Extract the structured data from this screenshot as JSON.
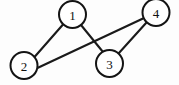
{
  "figure": {
    "background_color": "#fdfdfd",
    "ink_color": "#141414",
    "width": 179,
    "height": 85
  },
  "graph_data": {
    "type": "node-link-diagram",
    "directed": false,
    "node_radius": 13.5,
    "nodes": [
      {
        "id": "1",
        "label": "1",
        "cx": 72.5,
        "cy": 14.5
      },
      {
        "id": "2",
        "label": "2",
        "cx": 24.0,
        "cy": 65.5
      },
      {
        "id": "3",
        "label": "3",
        "cx": 109.5,
        "cy": 63.5
      },
      {
        "id": "4",
        "label": "4",
        "cx": 156.0,
        "cy": 12.5
      }
    ],
    "edges": [
      {
        "id": "e12",
        "source": "1",
        "target": "2",
        "x1": 63.0,
        "y1": 24.5,
        "x2": 34.5,
        "y2": 57.0
      },
      {
        "id": "e13",
        "source": "1",
        "target": "3",
        "x1": 81.0,
        "y1": 25.0,
        "x2": 103.0,
        "y2": 52.0
      },
      {
        "id": "e24",
        "source": "2",
        "target": "4",
        "x1": 37.4,
        "y1": 68.0,
        "x2": 143.0,
        "y2": 18.5
      },
      {
        "id": "e34",
        "source": "3",
        "target": "4",
        "x1": 118.5,
        "y1": 53.5,
        "x2": 146.5,
        "y2": 22.5
      }
    ],
    "crossings": [
      {
        "edges": [
          "e13",
          "e24"
        ],
        "x": 95.0,
        "y": 38.0
      }
    ]
  }
}
